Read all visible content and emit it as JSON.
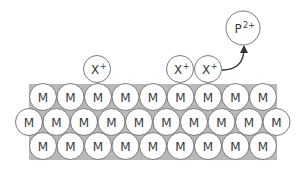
{
  "diagram": {
    "lattice": {
      "atom_label": "M",
      "rows": [
        {
          "y": 97,
          "xs": [
            43,
            70.5,
            98,
            125.5,
            153,
            180.5,
            208,
            235.5,
            263
          ]
        },
        {
          "y": 122,
          "xs": [
            29,
            56.5,
            84,
            111.5,
            139,
            166.5,
            194,
            221.5,
            249,
            276.5
          ]
        },
        {
          "y": 146,
          "xs": [
            43,
            70.5,
            98,
            125.5,
            153,
            180.5,
            208,
            235.5,
            263
          ]
        }
      ],
      "radius": 13.5,
      "fill_color": "#ffffff",
      "stroke_color": "#7a7a7a",
      "backing_color": "#b9b9b9"
    },
    "adsorbates": [
      {
        "label": "X",
        "charge": "+",
        "x": 97,
        "y": 69
      },
      {
        "label": "X",
        "charge": "+",
        "x": 180,
        "y": 69
      },
      {
        "label": "X",
        "charge": "+",
        "x": 208,
        "y": 69
      }
    ],
    "product": {
      "label": "P",
      "charge": "2+",
      "x": 243,
      "y": 28,
      "radius": 17
    },
    "arrow": {
      "from": [
        222,
        70
      ],
      "to": [
        244,
        48
      ],
      "color": "#333333"
    }
  }
}
